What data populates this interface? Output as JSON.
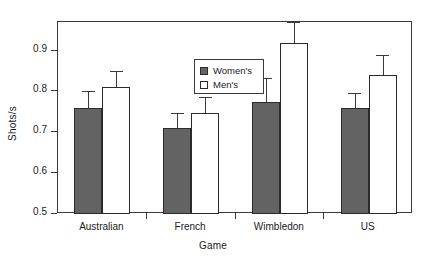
{
  "chart_data": {
    "type": "bar",
    "title": "",
    "xlabel": "Game",
    "ylabel": "Shots/s",
    "categories": [
      "Australian",
      "French",
      "Wimbledon",
      "US"
    ],
    "ylim": [
      0.5,
      0.97
    ],
    "yticks": [
      0.5,
      0.6,
      0.7,
      0.8,
      0.9
    ],
    "ytick_labels": [
      "0.5",
      "0.6",
      "0.7",
      "0.8",
      "0.9"
    ],
    "grid": false,
    "legend_position": "top-center",
    "series": [
      {
        "name": "Women's",
        "color": "#636363",
        "values": [
          0.76,
          0.71,
          0.775,
          0.76
        ],
        "errors": [
          0.04,
          0.037,
          0.058,
          0.037
        ]
      },
      {
        "name": "Men's",
        "color": "#ffffff",
        "values": [
          0.81,
          0.747,
          0.918,
          0.84
        ],
        "errors": [
          0.04,
          0.04,
          0.052,
          0.048
        ]
      }
    ]
  },
  "legend": {
    "items": [
      {
        "label": "Women's",
        "swatch": "filled-gray"
      },
      {
        "label": "Men's",
        "swatch": "open-white"
      }
    ]
  },
  "axes": {
    "y_title": "Shots/s",
    "x_title": "Game"
  }
}
